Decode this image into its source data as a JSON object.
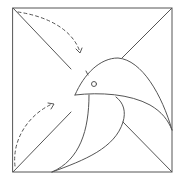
{
  "diagram": {
    "type": "origami-fold-diagram",
    "colors": {
      "line": "#555555",
      "background": "#ffffff"
    },
    "elements": [
      {
        "name": "paper-square",
        "kind": "square"
      },
      {
        "name": "diagonal-top-left",
        "kind": "crease"
      },
      {
        "name": "diagonal-top-right",
        "kind": "crease"
      },
      {
        "name": "diagonal-bottom-left",
        "kind": "crease"
      },
      {
        "name": "diagonal-bottom-right",
        "kind": "crease"
      },
      {
        "name": "bird-head",
        "kind": "shape"
      },
      {
        "name": "bird-eye",
        "kind": "circle"
      },
      {
        "name": "bird-body",
        "kind": "shape"
      },
      {
        "name": "bird-wing",
        "kind": "shape"
      },
      {
        "name": "fold-arrow-top",
        "kind": "dashed-arrow",
        "direction": "clockwise"
      },
      {
        "name": "fold-arrow-bottom",
        "kind": "dashed-arrow",
        "direction": "clockwise"
      }
    ]
  }
}
